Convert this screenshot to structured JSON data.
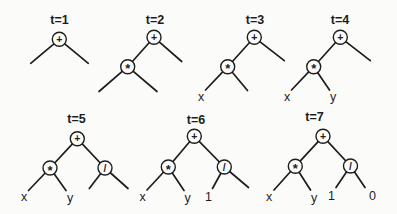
{
  "figure": {
    "width": 397,
    "height": 214,
    "background": "#fbfbfa",
    "ink": "#1d1d1d",
    "node_radius": 7,
    "edge_width": 1.7,
    "circle_stroke_width": 1.4,
    "trees": [
      {
        "label": "t=1",
        "label_x": 59.5,
        "label_y": 24,
        "nodes": [
          {
            "text": "+",
            "x": 59.3,
            "y": 39.3,
            "circled": true
          }
        ],
        "edges": [
          [
            59.3,
            39.3,
            30.7,
            63.3
          ],
          [
            59.3,
            39.3,
            88.3,
            63.3
          ]
        ]
      },
      {
        "label": "t=2",
        "label_x": 155,
        "label_y": 24,
        "nodes": [
          {
            "text": "+",
            "x": 154.0,
            "y": 37.3,
            "circled": true
          },
          {
            "text": "*",
            "x": 127.7,
            "y": 66.7,
            "circled": true
          }
        ],
        "edges": [
          [
            154.0,
            37.3,
            127.7,
            66.7
          ],
          [
            154.0,
            37.3,
            181.7,
            61.5
          ],
          [
            127.7,
            66.7,
            99.0,
            91.5
          ],
          [
            127.7,
            66.7,
            157.0,
            91.5
          ]
        ]
      },
      {
        "label": "t=3",
        "label_x": 255,
        "label_y": 24,
        "nodes": [
          {
            "text": "+",
            "x": 254.3,
            "y": 37.3,
            "circled": true
          },
          {
            "text": "*",
            "x": 227.7,
            "y": 66.7,
            "circled": true
          },
          {
            "text": "x",
            "x": 201.0,
            "y": 96.2,
            "circled": false
          }
        ],
        "edges": [
          [
            254.3,
            37.3,
            227.7,
            66.7
          ],
          [
            254.3,
            37.3,
            284.3,
            60.7
          ],
          [
            227.7,
            66.7,
            205.5,
            90.0
          ],
          [
            227.7,
            66.7,
            247.5,
            90.5
          ]
        ]
      },
      {
        "label": "t=4",
        "label_x": 340,
        "label_y": 24,
        "nodes": [
          {
            "text": "+",
            "x": 340.3,
            "y": 37.3,
            "circled": true
          },
          {
            "text": "*",
            "x": 313.7,
            "y": 66.7,
            "circled": true
          },
          {
            "text": "x",
            "x": 287.0,
            "y": 96.0,
            "circled": false
          },
          {
            "text": "y",
            "x": 333.0,
            "y": 96.5,
            "circled": false
          }
        ],
        "edges": [
          [
            340.3,
            37.3,
            313.7,
            66.7
          ],
          [
            340.3,
            37.3,
            370.3,
            60.7
          ],
          [
            313.7,
            66.7,
            291.5,
            90.0
          ],
          [
            313.7,
            66.7,
            329.5,
            90.0
          ]
        ]
      },
      {
        "label": "t=5",
        "label_x": 76.5,
        "label_y": 123,
        "nodes": [
          {
            "text": "+",
            "x": 77.3,
            "y": 138.7,
            "circled": true
          },
          {
            "text": "*",
            "x": 50.0,
            "y": 168.0,
            "circled": true
          },
          {
            "text": "/",
            "x": 105.0,
            "y": 168.0,
            "circled": true
          },
          {
            "text": "x",
            "x": 24.0,
            "y": 196.5,
            "circled": false
          },
          {
            "text": "y",
            "x": 70.0,
            "y": 197.0,
            "circled": false
          }
        ],
        "edges": [
          [
            77.3,
            138.7,
            50.0,
            168.0
          ],
          [
            77.3,
            138.7,
            105.0,
            168.0
          ],
          [
            50.0,
            168.0,
            28.5,
            190.5
          ],
          [
            50.0,
            168.0,
            66.0,
            190.5
          ],
          [
            105.0,
            168.0,
            89.3,
            188.5
          ],
          [
            105.0,
            168.0,
            128.0,
            188.5
          ]
        ]
      },
      {
        "label": "t=6",
        "label_x": 196,
        "label_y": 124,
        "nodes": [
          {
            "text": "+",
            "x": 194.3,
            "y": 136.3,
            "circled": true
          },
          {
            "text": "*",
            "x": 168.3,
            "y": 167.0,
            "circled": true
          },
          {
            "text": "/",
            "x": 224.3,
            "y": 167.0,
            "circled": true
          },
          {
            "text": "x",
            "x": 142.7,
            "y": 196.5,
            "circled": false
          },
          {
            "text": "y",
            "x": 187.7,
            "y": 197.0,
            "circled": false
          },
          {
            "text": "1",
            "x": 208.5,
            "y": 196.0,
            "circled": false
          }
        ],
        "edges": [
          [
            194.3,
            136.3,
            168.3,
            167.0
          ],
          [
            194.3,
            136.3,
            224.3,
            167.0
          ],
          [
            168.3,
            167.0,
            147.0,
            190.0
          ],
          [
            168.3,
            167.0,
            184.0,
            190.5
          ],
          [
            224.3,
            167.0,
            212.5,
            188.5
          ],
          [
            224.3,
            167.0,
            248.5,
            187.5
          ]
        ]
      },
      {
        "label": "t=7",
        "label_x": 314.5,
        "label_y": 121,
        "nodes": [
          {
            "text": "+",
            "x": 323.0,
            "y": 136.3,
            "circled": true
          },
          {
            "text": "*",
            "x": 295.3,
            "y": 166.3,
            "circled": true
          },
          {
            "text": "/",
            "x": 350.5,
            "y": 166.0,
            "circled": true
          },
          {
            "text": "x",
            "x": 269.0,
            "y": 196.5,
            "circled": false
          },
          {
            "text": "y",
            "x": 314.0,
            "y": 197.0,
            "circled": false
          },
          {
            "text": "1",
            "x": 331.5,
            "y": 195.8,
            "circled": false
          },
          {
            "text": "0",
            "x": 372.5,
            "y": 195.5,
            "circled": false
          }
        ],
        "edges": [
          [
            323.0,
            136.3,
            295.3,
            166.3
          ],
          [
            323.0,
            136.3,
            350.5,
            166.0
          ],
          [
            295.3,
            166.3,
            274.0,
            190.0
          ],
          [
            295.3,
            166.3,
            310.5,
            190.0
          ],
          [
            350.5,
            166.0,
            336.0,
            187.5
          ],
          [
            350.5,
            166.0,
            365.0,
            187.5
          ]
        ]
      }
    ]
  }
}
